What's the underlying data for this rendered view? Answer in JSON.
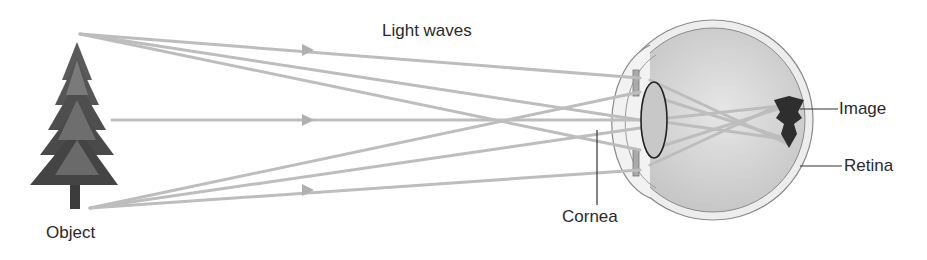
{
  "diagram": {
    "title": "Light waves",
    "labels": {
      "object": "Object",
      "cornea": "Cornea",
      "image": "Image",
      "retina": "Retina"
    },
    "colors": {
      "ray": "#b9b9b9",
      "eye_fill": "#d2d2d2",
      "sclera": "#ececec",
      "outline": "#8a8a8a",
      "tree_dark": "#4a4a4a",
      "tree_mid": "#6a6a6a",
      "text": "#2a2a2a"
    }
  }
}
